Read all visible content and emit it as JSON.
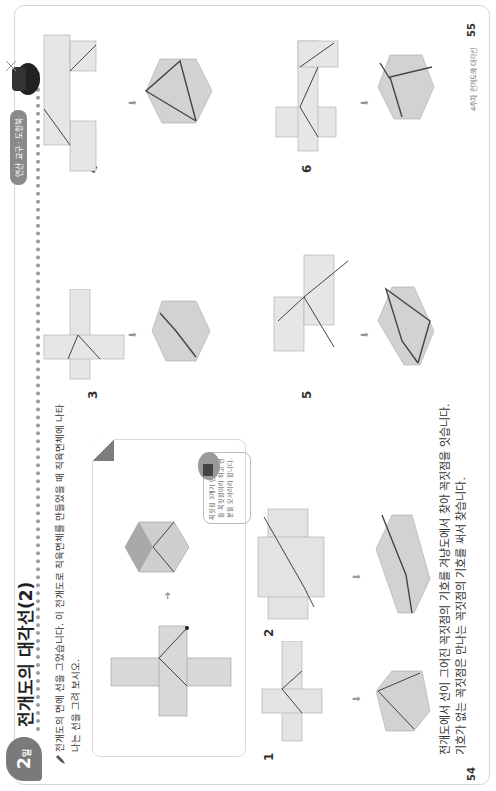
{
  "header": {
    "day_number": "2",
    "day_suffix": "일",
    "title": "전개도의 대각선(2)",
    "section_pill": "연산 교구 · 도형북"
  },
  "instruction": {
    "line1": "전개도의 면에 선을 그었습니다. 이 전개도로 직육면체를 만들었을 때 직육면체에 나타",
    "line2": "나는 선을 그려 보시오."
  },
  "example": {
    "bubble_text": "꼭짓점 3개가 만나는 점을 꼭짓점이라 하고 선분을 모서리라 합니다."
  },
  "problems": [
    {
      "number": "1"
    },
    {
      "number": "2"
    },
    {
      "number": "3"
    },
    {
      "number": "4"
    },
    {
      "number": "5"
    },
    {
      "number": "6"
    }
  ],
  "vertex_labels": [
    "ㄱ",
    "ㄴ",
    "ㄷ",
    "ㄹ",
    "ㅁ",
    "ㅂ",
    "ㅅ",
    "ㅇ"
  ],
  "footer": {
    "line1": "전개도에서 선이 그어진 꼭짓점의 기호를 겨냥도에서 찾아 꼭짓점을 잇습니다.",
    "line2": "기호가 없는 꼭짓점은 만나는 꼭짓점의 기호를 써서 찾습니다.",
    "page_left": "54",
    "page_right": "55",
    "page_right_label": "4주차 전개도와 대각선"
  },
  "colors": {
    "face_fill": "#d8d8d8",
    "face_dark": "#b8b8b8",
    "line": "#444444",
    "badge": "#7a7a7a"
  }
}
